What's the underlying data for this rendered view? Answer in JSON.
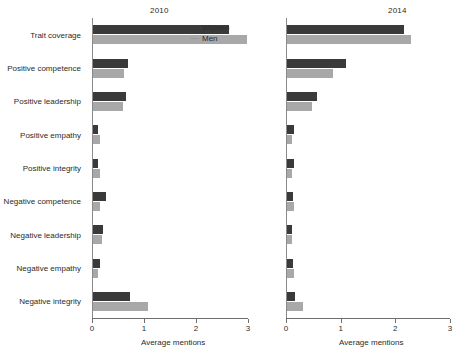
{
  "figure": {
    "axis_title": "Average mentions",
    "legend": [
      {
        "key": "women",
        "label": "Women",
        "color": "#3a3a3a"
      },
      {
        "key": "men",
        "label": "Men",
        "color": "#a8a8a8"
      }
    ],
    "tick_labels": [
      "0",
      "1",
      "2",
      "3"
    ],
    "panels": [
      {
        "id": "2010",
        "title": "2010"
      },
      {
        "id": "2014",
        "title": "2014"
      }
    ],
    "categories": [
      "Trait coverage",
      "Positive competence",
      "Positive leadership",
      "Positive empathy",
      "Positive integrity",
      "Negative competence",
      "Negative leadership",
      "Negative empathy",
      "Negative integrity"
    ]
  },
  "chart_data": [
    {
      "type": "bar",
      "title": "2010",
      "orientation": "horizontal",
      "xlabel": "Average mentions",
      "ylabel": "",
      "xlim": [
        0,
        3
      ],
      "xticks": [
        0,
        1,
        2,
        3
      ],
      "grid": false,
      "legend_position": "top-right",
      "categories": [
        "Trait coverage",
        "Positive competence",
        "Positive leadership",
        "Positive empathy",
        "Positive integrity",
        "Negative competence",
        "Negative leadership",
        "Negative empathy",
        "Negative integrity"
      ],
      "series": [
        {
          "name": "Women",
          "color": "#3a3a3a",
          "values": [
            2.62,
            0.68,
            0.64,
            0.1,
            0.09,
            0.25,
            0.19,
            0.13,
            0.72
          ]
        },
        {
          "name": "Men",
          "color": "#a8a8a8",
          "values": [
            2.96,
            0.6,
            0.58,
            0.13,
            0.13,
            0.14,
            0.17,
            0.1,
            1.05
          ]
        }
      ]
    },
    {
      "type": "bar",
      "title": "2014",
      "orientation": "horizontal",
      "xlabel": "Average mentions",
      "ylabel": "",
      "xlim": [
        0,
        3
      ],
      "xticks": [
        0,
        1,
        2,
        3
      ],
      "grid": false,
      "legend_position": "top-right",
      "categories": [
        "Trait coverage",
        "Positive competence",
        "Positive leadership",
        "Positive empathy",
        "Positive integrity",
        "Negative competence",
        "Negative leadership",
        "Negative empathy",
        "Negative integrity"
      ],
      "series": [
        {
          "name": "Women",
          "color": "#3a3a3a",
          "values": [
            2.14,
            1.08,
            0.55,
            0.12,
            0.12,
            0.11,
            0.1,
            0.11,
            0.15
          ]
        },
        {
          "name": "Men",
          "color": "#a8a8a8",
          "values": [
            2.27,
            0.85,
            0.46,
            0.1,
            0.1,
            0.13,
            0.09,
            0.13,
            0.3
          ]
        }
      ]
    }
  ]
}
